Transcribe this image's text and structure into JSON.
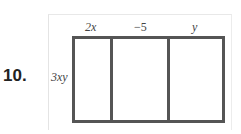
{
  "problem": {
    "number": "10.",
    "row_label": "3xy",
    "column_labels": [
      "2x",
      "−5",
      "y"
    ]
  }
}
